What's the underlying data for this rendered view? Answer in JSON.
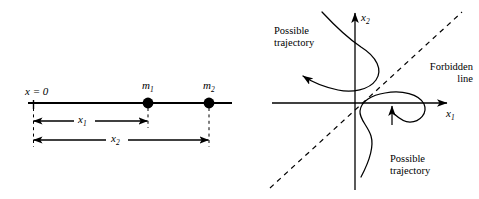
{
  "figure": {
    "background_color": "#ffffff",
    "ink_color": "#000000",
    "width": 479,
    "height": 199
  },
  "left_panel": {
    "name": "one-dimensional-mass-positions",
    "origin_label": "x = 0",
    "axis_line": {
      "label": "position-axis",
      "x_start": 28,
      "x_end": 232,
      "y": 103
    },
    "masses": [
      {
        "label": "m",
        "subscript": "1",
        "x": 148,
        "y": 103
      },
      {
        "label": "m",
        "subscript": "2",
        "x": 209,
        "y": 103
      }
    ],
    "dimensions": [
      {
        "label": "x",
        "subscript": "1",
        "from_x": 33,
        "to_x": 148,
        "y": 121
      },
      {
        "label": "x",
        "subscript": "2",
        "from_x": 33,
        "to_x": 209,
        "y": 140
      }
    ]
  },
  "right_panel": {
    "name": "configuration-space-trajectories",
    "origin": {
      "x": 355,
      "y": 103
    },
    "vertical_axis_label": {
      "label": "x",
      "subscript": "2"
    },
    "horizontal_axis_label": {
      "label": "x",
      "subscript": "1"
    },
    "forbidden_line_label": "Forbidden\nline",
    "forbidden_line_style": "dashed",
    "forbidden_line_angle_degrees": 45,
    "trajectories": [
      {
        "name": "upper-possible-trajectory",
        "label": "Possible\ntrajectory",
        "arrow_direction": "left"
      },
      {
        "name": "lower-possible-trajectory",
        "label": "Possible\ntrajectory",
        "arrow_direction": "up"
      }
    ]
  }
}
